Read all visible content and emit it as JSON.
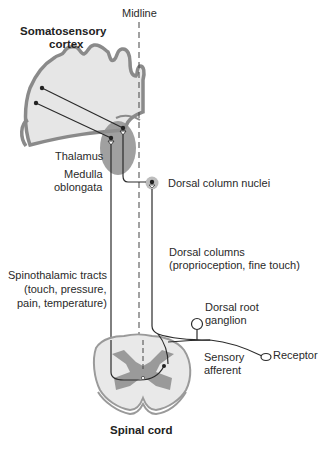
{
  "diagram": {
    "colors": {
      "line": "#2b2b2b",
      "cortex_fill": "#e6e6e6",
      "cortex_outline": "#8a8a8a",
      "thalamus_fill": "#8f8f8f",
      "gray_matter": "#9a9a9a",
      "white_matter": "#e9e9e9",
      "midline": "#444444"
    },
    "labels": {
      "midline": "Midline",
      "cortex_line1": "Somatosensory",
      "cortex_line2": "cortex",
      "thalamus": "Thalamus",
      "medulla_line1": "Medulla",
      "medulla_line2": "oblongata",
      "dorsal_column_nuclei": "Dorsal column nuclei",
      "dorsal_columns_line1": "Dorsal columns",
      "dorsal_columns_line2": "(proprioception, fine touch)",
      "spinothalamic_line1": "Spinothalamic tracts",
      "spinothalamic_line2": "(touch, pressure,",
      "spinothalamic_line3": "pain, temperature)",
      "drg_line1": "Dorsal root",
      "drg_line2": "ganglion",
      "sensory_afferent_line1": "Sensory",
      "sensory_afferent_line2": "afferent",
      "receptor": "Receptor",
      "spinal_cord": "Spinal cord"
    }
  }
}
